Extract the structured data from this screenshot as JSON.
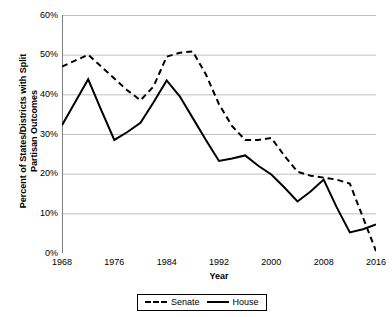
{
  "chart_data": {
    "type": "line",
    "title": "",
    "xlabel": "Year",
    "ylabel": "Percent of States/Districts with Split Partisan Outcomes",
    "ylabel_line1": "Percent of States/Districts with Split",
    "ylabel_line2": "Partisan Outcomes",
    "xlim": [
      1968,
      2016
    ],
    "ylim": [
      0,
      60
    ],
    "x_tick_labels": [
      "1968",
      "1976",
      "1984",
      "1992",
      "2000",
      "2008",
      "2016"
    ],
    "x_ticks": [
      1968,
      1976,
      1984,
      1992,
      2000,
      2008,
      2016
    ],
    "y_tick_labels": [
      "0%",
      "10%",
      "20%",
      "30%",
      "40%",
      "50%",
      "60%"
    ],
    "y_ticks": [
      0,
      10,
      20,
      30,
      40,
      50,
      60
    ],
    "grid": "horizontal",
    "legend_position": "bottom-center",
    "x": [
      1968,
      1970,
      1972,
      1974,
      1976,
      1978,
      1980,
      1982,
      1984,
      1986,
      1988,
      1990,
      1992,
      1994,
      1996,
      1998,
      2000,
      2002,
      2004,
      2006,
      2008,
      2010,
      2012,
      2014,
      2016
    ],
    "series": [
      {
        "name": "Senate",
        "style": "dashed",
        "color": "#000000",
        "values": [
          47.0,
          48.5,
          50.0,
          47.0,
          44.0,
          41.0,
          38.5,
          42.0,
          49.5,
          50.5,
          50.8,
          45.0,
          37.5,
          32.0,
          28.5,
          28.5,
          29.0,
          24.5,
          20.5,
          19.5,
          19.0,
          18.5,
          17.5,
          9.0,
          0.5
        ]
      },
      {
        "name": "House",
        "style": "solid",
        "color": "#000000",
        "values": [
          32.2,
          38.0,
          43.8,
          36.0,
          28.5,
          30.5,
          32.8,
          38.0,
          43.5,
          39.5,
          34.0,
          28.5,
          23.2,
          23.8,
          24.6,
          22.0,
          19.8,
          16.5,
          13.0,
          15.5,
          18.5,
          11.5,
          5.2,
          6.0,
          7.2
        ]
      }
    ]
  },
  "legend": {
    "entries": [
      {
        "label": "Senate",
        "style": "dashed"
      },
      {
        "label": "House",
        "style": "solid"
      }
    ]
  }
}
